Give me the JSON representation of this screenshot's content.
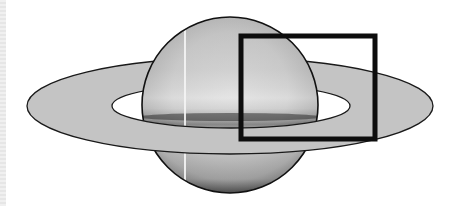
{
  "image": {
    "subject": "Saturn illustration",
    "description": "Grayscale drawing of the planet Saturn with its ring system; a black rectangle highlights the right portion of the planet and ring.",
    "alt": "Saturn with highlighted region"
  },
  "colors": {
    "background": "#ffffff",
    "planet_light": "#e4e4e4",
    "planet_mid": "#bdbdbd",
    "planet_dark": "#3a3a3a",
    "ring_fill": "#c4c4c4",
    "outline": "#1a1a1a",
    "highlight_box": "#0d0d0d"
  },
  "highlight_box": {
    "label": "highlighted region",
    "x": 239,
    "y": 34,
    "width": 138,
    "height": 107
  }
}
